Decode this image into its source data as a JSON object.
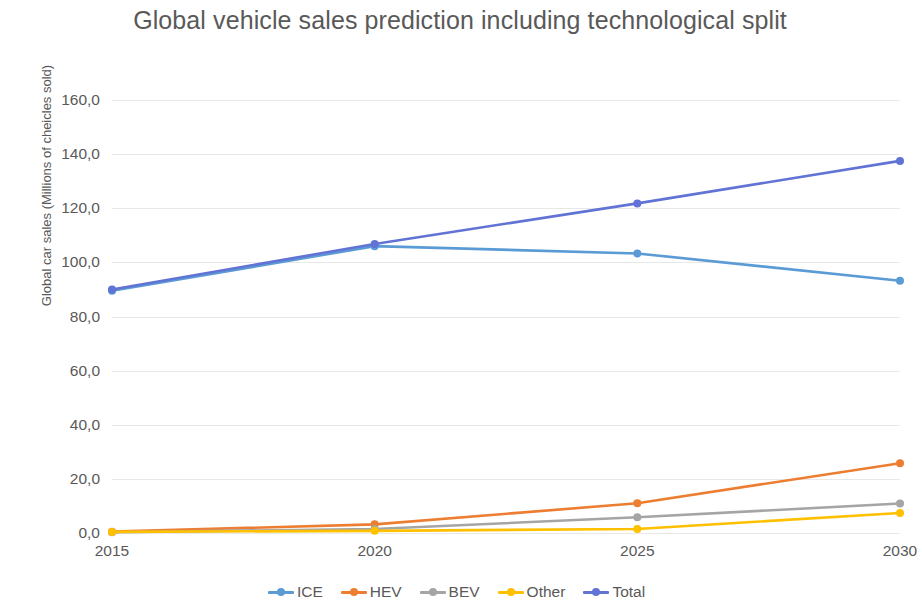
{
  "chart_data": {
    "type": "line",
    "title": "Global vehicle sales prediction including technological split",
    "title_line_1": "Global vehicle sales prediction including technological",
    "title_line_2": "split",
    "xlabel": "",
    "ylabel": "Global car sales (Millions of cheicles sold)",
    "categories": [
      "2015",
      "2020",
      "2025",
      "2030"
    ],
    "x": [
      2015,
      2020,
      2025,
      2030
    ],
    "ylim": [
      0,
      160
    ],
    "ytick_step": 20,
    "ytick_labels": [
      "0,0",
      "20,0",
      "40,0",
      "60,0",
      "80,0",
      "100,0",
      "120,0",
      "140,0",
      "160,0"
    ],
    "ytick_values": [
      0,
      20,
      40,
      60,
      80,
      100,
      120,
      140,
      160
    ],
    "grid": "horizontal",
    "legend_position": "bottom",
    "markers": true,
    "series": [
      {
        "name": "ICE",
        "color": "#5B9BD5",
        "values": [
          89.5,
          106.0,
          103.3,
          93.2
        ]
      },
      {
        "name": "HEV",
        "color": "#ED7D31",
        "values": [
          0.5,
          3.2,
          11.0,
          25.8
        ]
      },
      {
        "name": "BEV",
        "color": "#A5A5A5",
        "values": [
          0.3,
          1.5,
          5.8,
          10.9
        ]
      },
      {
        "name": "Other",
        "color": "#FFC000",
        "values": [
          0.4,
          0.8,
          1.5,
          7.4
        ]
      },
      {
        "name": "Total",
        "color": "#6173D4",
        "values": [
          90.0,
          106.8,
          121.8,
          137.5
        ]
      }
    ]
  },
  "legend": {
    "items": [
      {
        "label": "ICE"
      },
      {
        "label": "HEV"
      },
      {
        "label": "BEV"
      },
      {
        "label": "Other"
      },
      {
        "label": "Total"
      }
    ]
  }
}
